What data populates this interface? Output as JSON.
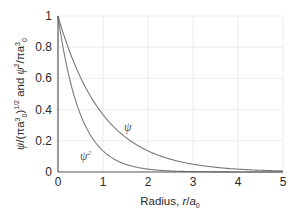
{
  "chart_data": {
    "type": "line",
    "title": "",
    "xlabel": "Radius, r/a0",
    "xlabel_parts": {
      "prefix": "Radius, ",
      "var": "r",
      "slash": "/",
      "a": "a",
      "sub": "0"
    },
    "ylabel": "ψ/(πa0^3)^1/2 and ψ^2/πa0^3",
    "xlim": [
      0,
      5
    ],
    "ylim": [
      0,
      1
    ],
    "x_ticks": [
      "0",
      "1",
      "2",
      "3",
      "4",
      "5"
    ],
    "y_ticks": [
      "0",
      "0.2",
      "0.4",
      "0.6",
      "0.8",
      "1"
    ],
    "grid": true,
    "legend": "inline labels on curves",
    "x": [
      0,
      0.25,
      0.5,
      0.75,
      1,
      1.25,
      1.5,
      1.75,
      2,
      2.5,
      3,
      3.5,
      4,
      4.5,
      5
    ],
    "series": [
      {
        "name": "ψ",
        "label_position": {
          "x": 1.5,
          "y": 0.27
        },
        "values": [
          1.0,
          0.779,
          0.607,
          0.472,
          0.368,
          0.287,
          0.223,
          0.174,
          0.135,
          0.082,
          0.05,
          0.03,
          0.018,
          0.011,
          0.007
        ]
      },
      {
        "name": "ψ²",
        "label_position": {
          "x": 0.6,
          "y": 0.09
        },
        "values": [
          1.0,
          0.607,
          0.368,
          0.223,
          0.135,
          0.082,
          0.05,
          0.03,
          0.018,
          0.007,
          0.002,
          0.001,
          0.0,
          0.0,
          0.0
        ]
      }
    ]
  },
  "labels": {
    "psi": "ψ",
    "psi2_base": "ψ",
    "psi2_sup": "2"
  },
  "colors": {
    "curve": "#7a7a7a",
    "axis": "#555555",
    "grid": "#ececec",
    "text": "#2a2a2a"
  }
}
